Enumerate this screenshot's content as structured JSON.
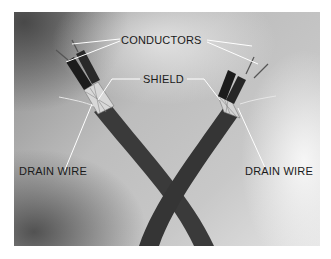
{
  "figure": {
    "labels": {
      "conductors": "CONDUCTORS",
      "shield": "SHIELD",
      "drain_wire_left": "DRAIN WIRE",
      "drain_wire_right": "DRAIN WIRE"
    },
    "colors": {
      "background": "#ffffff",
      "photo_mid": "#bdbdbd",
      "cable_jacket": "#3a3a3a",
      "label_text": "#1a1a1a",
      "leader_line": "#ffffff"
    }
  }
}
